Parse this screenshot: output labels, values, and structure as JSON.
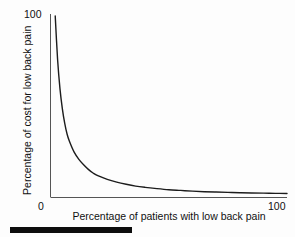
{
  "figure": {
    "background_color": "#fdfdfd",
    "axis_color": "#555555",
    "curve_color": "#1c1c1c",
    "bar_color": "#0d0d0d"
  },
  "axes": {
    "y_tick_top": "100",
    "y_tick_bottom": "0",
    "x_tick_left": "0",
    "x_tick_right": "100",
    "y_title": "Percentage of cost for low back pain",
    "x_title": "Percentage of patients with low back pain"
  },
  "chart_data": {
    "type": "line",
    "title": "",
    "subtitle": "",
    "xlabel": "Percentage of patients with low back pain",
    "ylabel": "Percentage of cost for low back pain",
    "xlim": [
      0,
      100
    ],
    "ylim": [
      0,
      100
    ],
    "xticks": [
      0,
      100
    ],
    "xticklabels": [
      "0",
      "100"
    ],
    "yticks": [
      0,
      100
    ],
    "yticklabels": [
      "0",
      "100"
    ],
    "grid": false,
    "legend": null,
    "annotations": [],
    "series": [
      {
        "name": "Cost concentration curve",
        "color": "#1c1c1c",
        "linewidth": 1.4,
        "x": [
          2,
          3,
          4,
          5,
          6,
          7,
          8,
          10,
          12,
          14,
          16,
          18,
          20,
          24,
          28,
          32,
          36,
          40,
          45,
          50,
          55,
          60,
          65,
          70,
          75,
          80,
          85,
          90,
          95,
          100
        ],
        "y": [
          100,
          76,
          60,
          49,
          41,
          35,
          31,
          25,
          21,
          18,
          15.5,
          13.5,
          12,
          10,
          8.5,
          7.3,
          6.3,
          5.6,
          4.9,
          4.3,
          3.9,
          3.5,
          3.2,
          3.0,
          2.8,
          2.6,
          2.5,
          2.4,
          2.3,
          2.2
        ]
      }
    ]
  },
  "bottom_bar": {
    "label": "scale-bar"
  }
}
